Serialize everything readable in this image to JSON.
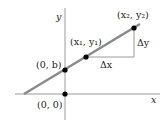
{
  "diagram": {
    "axes": {
      "x_label": "x",
      "y_label": "y"
    },
    "points": {
      "origin": "(0, 0)",
      "intercept": "(0, b)",
      "p1": "(x₁, y₁)",
      "p2": "(x₂, y₂)"
    },
    "deltas": {
      "dx": "Δx",
      "dy": "Δy"
    },
    "colors": {
      "line": "#8a8a8a",
      "axes": "#9a9a9a",
      "points": "#000000"
    }
  }
}
